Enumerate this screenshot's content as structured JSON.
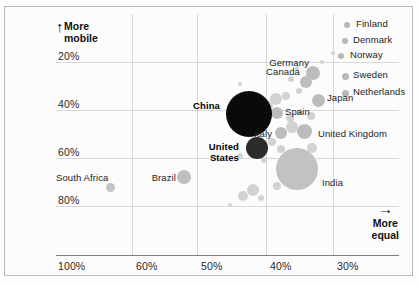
{
  "chart_data": {
    "type": "scatter",
    "title": "",
    "xlabel": "More equal",
    "ylabel": "How much a child's income\nis determined by their parents'",
    "y_axis_caption": "More\nmobile",
    "x_axis_caption": "More\nequal",
    "yticks": [
      "20%",
      "40%",
      "60%",
      "80%"
    ],
    "xticks": [
      "100%",
      "60%",
      "50%",
      "40%",
      "30%"
    ],
    "grid": true,
    "legend": "none",
    "note": "Bubble size encodes population; x axis = income inequality measure, y axis = intergenerational income elasticity",
    "points": [
      {
        "name": "Finland",
        "x": 347,
        "y": 25,
        "r": 3,
        "color": "#b7b7b7",
        "label_x": 356,
        "label_y": 18,
        "align": "left",
        "bold": false
      },
      {
        "name": "Denmark",
        "x": 345,
        "y": 41,
        "r": 3,
        "color": "#b7b7b7",
        "label_x": 353,
        "label_y": 34,
        "align": "left",
        "bold": false
      },
      {
        "name": "Norway",
        "x": 341,
        "y": 56,
        "r": 3,
        "color": "#b7b7b7",
        "label_x": 350,
        "label_y": 49,
        "align": "left",
        "bold": false
      },
      {
        "name": "Sweden",
        "x": 345,
        "y": 76,
        "r": 3.5,
        "color": "#b7b7b7",
        "label_x": 353,
        "label_y": 69,
        "align": "left",
        "bold": false
      },
      {
        "name": "Netherlands",
        "x": 345,
        "y": 93,
        "r": 3.5,
        "color": "#b7b7b7",
        "label_x": 353,
        "label_y": 86,
        "align": "left",
        "bold": false
      },
      {
        "name": "Germany",
        "x": 313,
        "y": 73,
        "r": 7,
        "color": "#bcbcbc",
        "label_x": 309,
        "label_y": 57,
        "align": "right",
        "bold": false
      },
      {
        "name": "Canada",
        "x": 306,
        "y": 82,
        "r": 6,
        "color": "#bdbdbd",
        "label_x": 300,
        "label_y": 66,
        "align": "right",
        "bold": false
      },
      {
        "name": "Japan",
        "x": 318,
        "y": 100,
        "r": 6.5,
        "color": "#bcbcbc",
        "label_x": 327,
        "label_y": 92,
        "align": "left",
        "bold": false
      },
      {
        "name": "Spain",
        "x": 277,
        "y": 113,
        "r": 6,
        "color": "#bcbcbc",
        "label_x": 285,
        "label_y": 106,
        "align": "left",
        "bold": false
      },
      {
        "name": "Italy",
        "x": 281,
        "y": 133,
        "r": 6,
        "color": "#bcbcbc",
        "label_x": 272,
        "label_y": 128,
        "align": "right",
        "bold": false
      },
      {
        "name": "United Kingdom",
        "x": 304,
        "y": 131,
        "r": 7.5,
        "color": "#bcbcbc",
        "label_x": 318,
        "label_y": 128,
        "align": "left",
        "bold": false
      },
      {
        "name": "China",
        "x": 249,
        "y": 114,
        "r": 23,
        "color": "#0a0a0a",
        "label_x": 220,
        "label_y": 100,
        "align": "right",
        "bold": true
      },
      {
        "name": "United States",
        "x": 257,
        "y": 148,
        "r": 11,
        "color": "#2b2b2b",
        "label_x": 239,
        "label_y": 142,
        "align": "right",
        "bold": true,
        "two_line": true
      },
      {
        "name": "India",
        "x": 297,
        "y": 169,
        "r": 21,
        "color": "#c2c2c2",
        "label_x": 322,
        "label_y": 177,
        "align": "left",
        "bold": false
      },
      {
        "name": "Brazil",
        "x": 184,
        "y": 177,
        "r": 7,
        "color": "#bfbfbf",
        "label_x": 176,
        "label_y": 172,
        "align": "right",
        "bold": false
      },
      {
        "name": "South Africa",
        "x": 110,
        "y": 187,
        "r": 4.5,
        "color": "#c3c3c3",
        "label_x": 104,
        "label_y": 172,
        "align": "right",
        "bold": false
      }
    ],
    "background_points": [
      {
        "x": 291,
        "y": 79,
        "r": 3
      },
      {
        "x": 299,
        "y": 91,
        "r": 3
      },
      {
        "x": 286,
        "y": 96,
        "r": 4
      },
      {
        "x": 276,
        "y": 99,
        "r": 6
      },
      {
        "x": 268,
        "y": 106,
        "r": 5
      },
      {
        "x": 290,
        "y": 118,
        "r": 4
      },
      {
        "x": 300,
        "y": 112,
        "r": 3
      },
      {
        "x": 311,
        "y": 116,
        "r": 4
      },
      {
        "x": 292,
        "y": 127,
        "r": 6
      },
      {
        "x": 272,
        "y": 142,
        "r": 4
      },
      {
        "x": 281,
        "y": 149,
        "r": 4
      },
      {
        "x": 312,
        "y": 148,
        "r": 5
      },
      {
        "x": 264,
        "y": 160,
        "r": 3
      },
      {
        "x": 240,
        "y": 156,
        "r": 3
      },
      {
        "x": 277,
        "y": 186,
        "r": 4
      },
      {
        "x": 253,
        "y": 190,
        "r": 6
      },
      {
        "x": 243,
        "y": 196,
        "r": 5
      },
      {
        "x": 261,
        "y": 198,
        "r": 3
      },
      {
        "x": 230,
        "y": 205,
        "r": 2
      },
      {
        "x": 322,
        "y": 62,
        "r": 2
      },
      {
        "x": 333,
        "y": 53,
        "r": 2
      },
      {
        "x": 297,
        "y": 68,
        "r": 2
      },
      {
        "x": 240,
        "y": 84,
        "r": 2
      }
    ]
  }
}
